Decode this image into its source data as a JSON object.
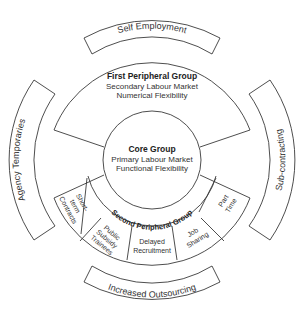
{
  "diagram": {
    "core": {
      "title": "Core Group",
      "line1": "Primary Labour Market",
      "line2": "Functional Flexibility"
    },
    "first_peripheral": {
      "title": "First Peripheral Group",
      "line1": "Secondary Labour Market",
      "line2": "Numerical Flexibility"
    },
    "second_peripheral": {
      "title": "Second Peripheral Group",
      "segments": [
        {
          "lines": [
            "Short-",
            "term",
            "Contracts"
          ]
        },
        {
          "lines": [
            "Public",
            "Subsidy",
            "Trainees"
          ]
        },
        {
          "lines": [
            "Delayed",
            "Recruitment"
          ]
        },
        {
          "lines": [
            "Job",
            "Sharing"
          ]
        },
        {
          "lines": [
            "Part",
            "Time"
          ]
        }
      ]
    },
    "outer_bands": {
      "top": "Self Employment",
      "left": "Agency Temporaries",
      "right": "Sub-contracting",
      "bottom": "Increased Outsourcing"
    },
    "colors": {
      "stroke": "#3a3a3a",
      "text": "#333333",
      "background": "#ffffff"
    }
  }
}
